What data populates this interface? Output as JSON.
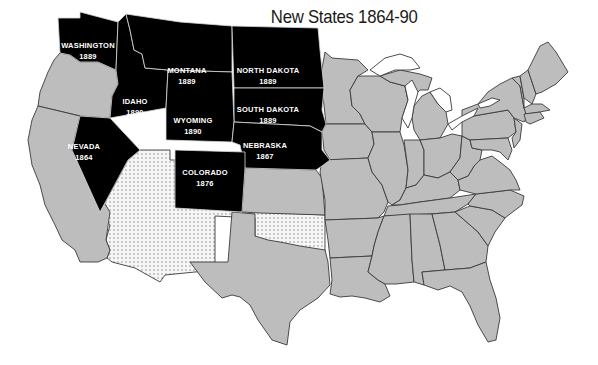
{
  "title": "New States 1864-90",
  "legend_colors": {
    "new_state": "#000000",
    "existing_state": "#bdbdbd",
    "territory": "#f4f4f4",
    "background": "#ffffff"
  },
  "new_states": [
    {
      "name": "WASHINGTON",
      "year": "1889"
    },
    {
      "name": "MONTANA",
      "year": "1889"
    },
    {
      "name": "NORTH DAKOTA",
      "year": "1889"
    },
    {
      "name": "IDAHO",
      "year": "1890"
    },
    {
      "name": "WYOMING",
      "year": "1890"
    },
    {
      "name": "SOUTH DAKOTA",
      "year": "1889"
    },
    {
      "name": "NEVADA",
      "year": "1864"
    },
    {
      "name": "NEBRASKA",
      "year": "1867"
    },
    {
      "name": "COLORADO",
      "year": "1876"
    }
  ]
}
